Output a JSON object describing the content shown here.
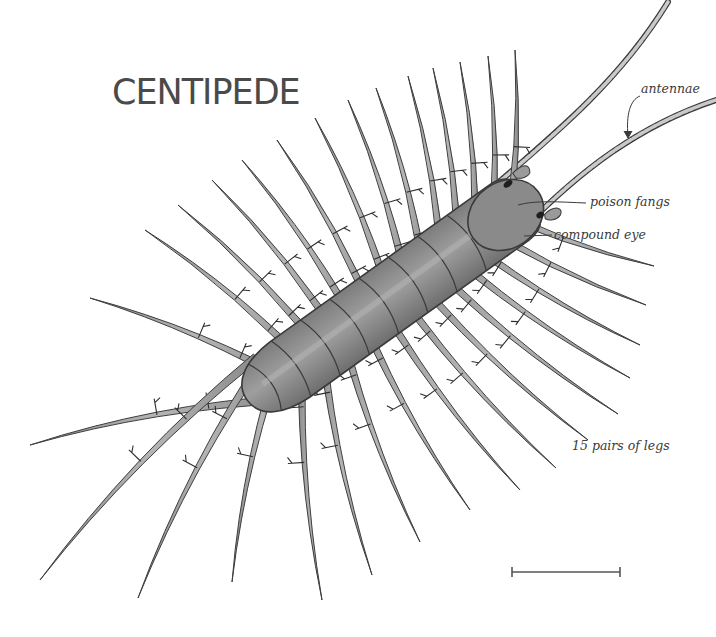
{
  "title": "CENTIPEDE",
  "labels": {
    "antennae": "antennae",
    "poison_fangs": "poison fangs",
    "compound_eye": "compound eye",
    "legs": "15 pairs of legs"
  },
  "colors": {
    "title": "#4a4a4a",
    "label": "#3a3a3a",
    "body_fill": "#8e8e8e",
    "body_stroke": "#3c3c3c",
    "leg_fill": "#9c9c9c",
    "leg_light": "#c8c8c8",
    "background": "#ffffff"
  },
  "diagram": {
    "subject": "centipede",
    "leg_pairs": 15,
    "body_segments": 9,
    "annotated_parts": [
      "antennae",
      "poison fangs",
      "compound eye",
      "15 pairs of legs"
    ],
    "scale_bar": {
      "x1": 512,
      "x2": 620,
      "y": 572
    }
  }
}
